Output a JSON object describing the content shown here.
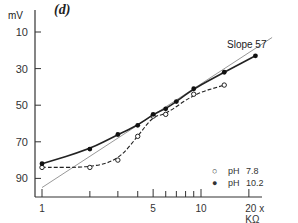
{
  "chart_data": {
    "type": "line",
    "panel_label": "(d)",
    "title": "",
    "xlabel": "x KΩ",
    "ylabel": "mV",
    "xscale": "log",
    "x_ticks_major": [
      1,
      5,
      10,
      20
    ],
    "x_ticks_minor": [
      2,
      3,
      4,
      6,
      7,
      8,
      9
    ],
    "x_tick_labels": [
      "1",
      "5",
      "10",
      "20 x KΩ"
    ],
    "y_ticks": [
      10,
      30,
      50,
      70,
      90
    ],
    "y_tick_labels": [
      "10",
      "30",
      "50",
      "70",
      "90"
    ],
    "yaxis_inverted": true,
    "xlim": [
      0.95,
      28
    ],
    "ylim": [
      100,
      0
    ],
    "grid": false,
    "legend_position": "lower right",
    "series": [
      {
        "name": "pH 7.8",
        "marker": "open-circle",
        "line": "dashed",
        "x": [
          1,
          2,
          3,
          4,
          5,
          6,
          9,
          14
        ],
        "y": [
          84,
          84,
          80,
          67,
          56,
          55,
          44,
          39
        ]
      },
      {
        "name": "pH 10.2",
        "marker": "filled-circle",
        "line": "solid",
        "x": [
          1,
          2,
          3,
          4,
          5,
          6,
          7,
          9,
          14,
          22
        ],
        "y": [
          82,
          74,
          66,
          61,
          55,
          52,
          48,
          41,
          32,
          23
        ]
      }
    ],
    "reference_line": {
      "label": "Slope 57",
      "x": [
        1,
        28
      ],
      "y": [
        95,
        13
      ]
    }
  },
  "labels": {
    "panel": "(d)",
    "yunit": "mV",
    "slope": "Slope 57",
    "legend": [
      {
        "marker": "○",
        "ph": "pH",
        "value": "7.8"
      },
      {
        "marker": "●",
        "ph": "pH",
        "value": "10.2"
      }
    ]
  }
}
